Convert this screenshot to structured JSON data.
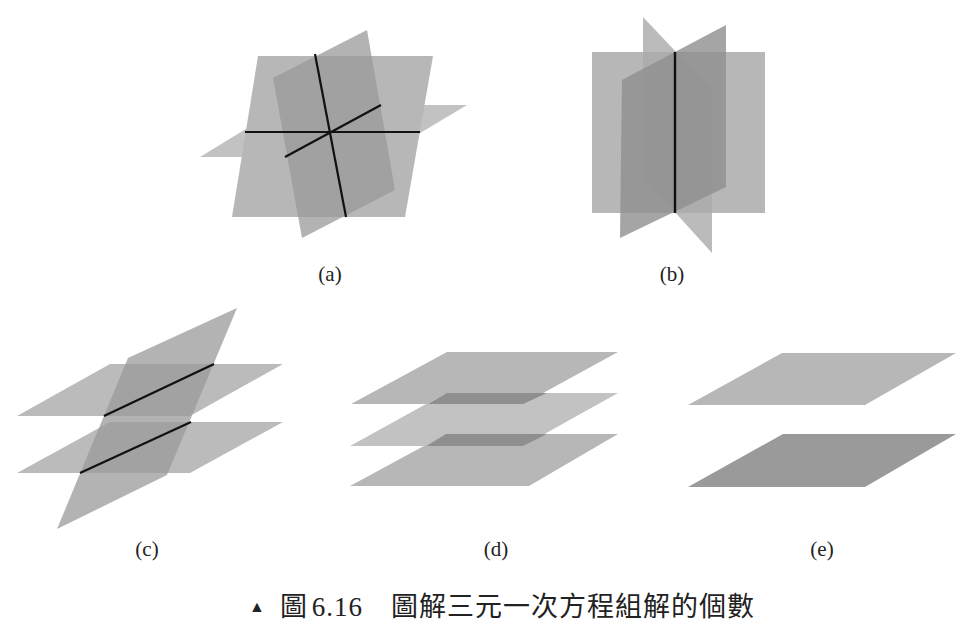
{
  "figure": {
    "caption": {
      "marker": "▲",
      "prefix": "圖",
      "number": "6.16",
      "text": "圖解三元一次方程組解的個數"
    },
    "colors": {
      "plane_light": "#b7b7b7",
      "plane_dark": "#8f8f8f",
      "line": "#111111",
      "edge": "#d6d6d6"
    },
    "panels": [
      {
        "id": "a",
        "label": "(a)",
        "description": "three planes intersecting at a single point"
      },
      {
        "id": "b",
        "label": "(b)",
        "description": "three planes sharing a common line"
      },
      {
        "id": "c",
        "label": "(c)",
        "description": "two parallel planes cut by a third plane"
      },
      {
        "id": "d",
        "label": "(d)",
        "description": "three parallel planes"
      },
      {
        "id": "e",
        "label": "(e)",
        "description": "two parallel planes"
      }
    ]
  }
}
